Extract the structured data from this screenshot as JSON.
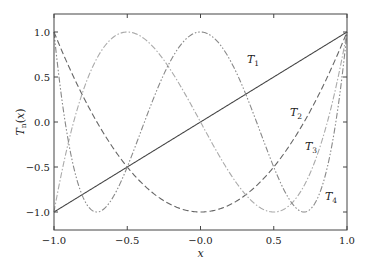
{
  "chart_data": {
    "type": "line",
    "title": "",
    "xlabel": "x",
    "ylabel": "T_n(x)",
    "xlim": [
      -1.0,
      1.0
    ],
    "ylim": [
      -1.2,
      1.2
    ],
    "xticks": [
      -1.0,
      -0.5,
      0.0,
      0.5,
      1.0
    ],
    "xtick_labels": [
      "−1.0",
      "−0.5",
      "−0.0",
      "0.5",
      "1.0"
    ],
    "yticks": [
      -1.0,
      -0.5,
      0.0,
      0.5,
      1.0
    ],
    "ytick_labels": [
      "−1.0",
      "−0.5",
      "0.0",
      "0.5",
      "1.0"
    ],
    "grid": false,
    "legend": "inline labels",
    "series": [
      {
        "name": "T1",
        "label_main": "T",
        "label_sub": "1",
        "formula": "x",
        "style": "solid",
        "color": "#444444",
        "x": [
          -1.0,
          -0.5,
          0.0,
          0.5,
          1.0
        ],
        "values": [
          -1.0,
          -0.5,
          0.0,
          0.5,
          1.0
        ],
        "label_pos": [
          247,
          63
        ]
      },
      {
        "name": "T2",
        "label_main": "T",
        "label_sub": "2",
        "formula": "2x^2-1",
        "style": "dashed",
        "color": "#666666",
        "x": [
          -1.0,
          -0.5,
          0.0,
          0.5,
          1.0
        ],
        "values": [
          1.0,
          -0.5,
          -1.0,
          -0.5,
          1.0
        ],
        "label_pos": [
          290,
          116
        ]
      },
      {
        "name": "T3",
        "label_main": "T",
        "label_sub": "3",
        "formula": "4x^3-3x",
        "style": "dashdot",
        "color": "#aaaaaa",
        "x": [
          -1.0,
          -0.5,
          0.0,
          0.5,
          1.0
        ],
        "values": [
          -1.0,
          1.0,
          0.0,
          -1.0,
          1.0
        ],
        "label_pos": [
          305,
          150
        ]
      },
      {
        "name": "T4",
        "label_main": "T",
        "label_sub": "4",
        "formula": "8x^4-8x^2+1",
        "style": "dashdotdot",
        "color": "#888888",
        "x": [
          -1.0,
          -0.5,
          0.0,
          0.5,
          1.0
        ],
        "values": [
          1.0,
          -0.5,
          1.0,
          -0.5,
          1.0
        ],
        "label_pos": [
          325,
          200
        ]
      }
    ]
  },
  "layout": {
    "plot_left": 54,
    "plot_right": 347,
    "plot_top": 14,
    "plot_bottom": 230,
    "x_at_minus1": 54,
    "x_at_plus1": 347,
    "y_at_plus1": 32,
    "y_at_minus1": 212
  }
}
